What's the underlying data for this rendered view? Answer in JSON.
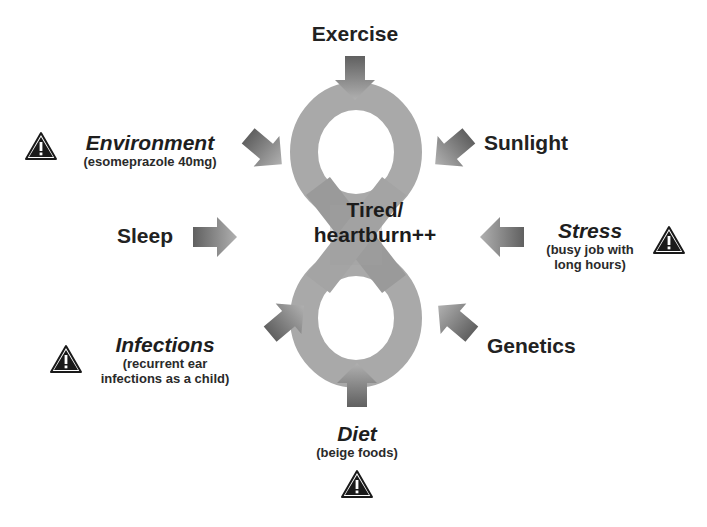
{
  "diagram": {
    "center": {
      "line1": "Tired/",
      "line2": "heartburn++"
    },
    "factors": {
      "exercise": {
        "title": "Exercise"
      },
      "sunlight": {
        "title": "Sunlight"
      },
      "environment": {
        "title": "Environment",
        "detail": "(esomeprazole 40mg)",
        "warning": true
      },
      "sleep": {
        "title": "Sleep"
      },
      "stress": {
        "title": "Stress",
        "detail_line1": "(busy job with",
        "detail_line2": "long hours)",
        "warning": true
      },
      "infections": {
        "title": "Infections",
        "detail_line1": "(recurrent ear",
        "detail_line2": "infections as a child)",
        "warning": true
      },
      "genetics": {
        "title": "Genetics"
      },
      "diet": {
        "title": "Diet",
        "detail": "(beige foods)",
        "warning": true
      }
    },
    "icons": {
      "warning": "warning-triangle-icon",
      "arrow": "block-arrow-icon",
      "infinity_loop": "figure-eight-loop"
    },
    "colors": {
      "loop": "#a9a9a9",
      "arrow_dark": "#555555",
      "arrow_light": "#b5b5b5",
      "text": "#1e1e1e",
      "warning_fill": "#1a1a1a"
    }
  }
}
